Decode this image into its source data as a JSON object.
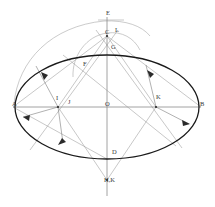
{
  "figure": {
    "kind": "geometric-construction-diagram",
    "title_text": "",
    "background_color": "#ffffff",
    "colors": {
      "ellipse_stroke": "#1a1a1a",
      "construction_line": "#9a9a9a",
      "axis_line": "#8c8c8c",
      "arc_stroke": "#a8a8a8",
      "label_text": "#3a3a3a",
      "arrow_fill": "#2b2b2b"
    },
    "canvas": {
      "width": 215,
      "height": 207
    },
    "labels": [
      {
        "id": "E",
        "text": "E",
        "x": 106,
        "y": 14
      },
      {
        "id": "L",
        "text": "L",
        "x": 115,
        "y": 31
      },
      {
        "id": "C",
        "text": "C",
        "x": 105,
        "y": 33
      },
      {
        "id": "G",
        "text": "G",
        "x": 111,
        "y": 48
      },
      {
        "id": "F",
        "text": "F",
        "x": 83,
        "y": 65
      },
      {
        "id": "A",
        "text": "A",
        "x": 12,
        "y": 105
      },
      {
        "id": "I",
        "text": "I",
        "x": 56,
        "y": 99
      },
      {
        "id": "J",
        "text": "J",
        "x": 68,
        "y": 103
      },
      {
        "id": "O",
        "text": "O",
        "x": 105,
        "y": 105
      },
      {
        "id": "K",
        "text": "K",
        "x": 156,
        "y": 98
      },
      {
        "id": "B",
        "text": "B",
        "x": 200,
        "y": 105
      },
      {
        "id": "D",
        "text": "D",
        "x": 112,
        "y": 153
      },
      {
        "id": "HK",
        "text": "H,K",
        "x": 104,
        "y": 181
      }
    ],
    "ellipse": {
      "center_x": 107,
      "center_y": 107,
      "radius_x": 92,
      "radius_y": 52
    },
    "axes": {
      "horizontal": {
        "x1": 13,
        "y1": 107,
        "x2": 201,
        "y2": 107
      },
      "vertical": {
        "x1": 107,
        "y1": 17,
        "x2": 107,
        "y2": 196
      }
    },
    "arcs": [
      {
        "id": "large-arc",
        "d": "M 14 104 C 18 60 52 26 104 21 C 126 20 142 26 150 36"
      },
      {
        "id": "small-arc",
        "d": "M 73 77 C 72 56 86 36 107 33 C 122 31 134 38 140 50"
      }
    ],
    "construction_lines": [
      {
        "id": "line-A-to-C",
        "x1": 13,
        "y1": 107,
        "x2": 107,
        "y2": 36
      },
      {
        "id": "line-B-to-C",
        "x1": 201,
        "y1": 107,
        "x2": 107,
        "y2": 36
      },
      {
        "id": "line-A-to-D",
        "x1": 13,
        "y1": 107,
        "x2": 107,
        "y2": 159
      },
      {
        "id": "line-I-to-C",
        "x1": 58,
        "y1": 107,
        "x2": 107,
        "y2": 36
      },
      {
        "id": "line-K-to-C",
        "x1": 156,
        "y1": 107,
        "x2": 107,
        "y2": 36
      },
      {
        "id": "line-I-to-HK",
        "x1": 58,
        "y1": 107,
        "x2": 107,
        "y2": 180
      },
      {
        "id": "line-K-to-HK",
        "x1": 156,
        "y1": 107,
        "x2": 107,
        "y2": 180
      },
      {
        "id": "line-C-to-HK",
        "x1": 107,
        "y1": 36,
        "x2": 107,
        "y2": 188
      },
      {
        "id": "line-F-through-K",
        "x1": 63,
        "y1": 55,
        "x2": 176,
        "y2": 146
      },
      {
        "id": "line-L-slant-left",
        "x1": 118,
        "y1": 30,
        "x2": 30,
        "y2": 150
      },
      {
        "id": "line-L-slant-right",
        "x1": 96,
        "y1": 30,
        "x2": 182,
        "y2": 148
      },
      {
        "id": "tick-E-horizontal",
        "x1": 98,
        "y1": 20,
        "x2": 124,
        "y2": 20
      }
    ],
    "arrow_rays": [
      {
        "id": "ray-I-upleft",
        "x1": 58,
        "y1": 107,
        "x2": 36,
        "y2": 66
      },
      {
        "id": "ray-I-downleft",
        "x1": 58,
        "y1": 107,
        "x2": 23,
        "y2": 117
      },
      {
        "id": "ray-I-downright",
        "x1": 58,
        "y1": 107,
        "x2": 63,
        "y2": 143
      },
      {
        "id": "ray-K-upleft",
        "x1": 156,
        "y1": 107,
        "x2": 146,
        "y2": 65
      },
      {
        "id": "ray-K-downright",
        "x1": 156,
        "y1": 107,
        "x2": 189,
        "y2": 124
      }
    ],
    "vertex_dots": [
      {
        "id": "dot-C",
        "x": 107,
        "y": 36
      },
      {
        "id": "dot-I",
        "x": 58,
        "y": 107
      },
      {
        "id": "dot-K",
        "x": 156,
        "y": 107
      },
      {
        "id": "dot-HK",
        "x": 107,
        "y": 180
      }
    ]
  }
}
